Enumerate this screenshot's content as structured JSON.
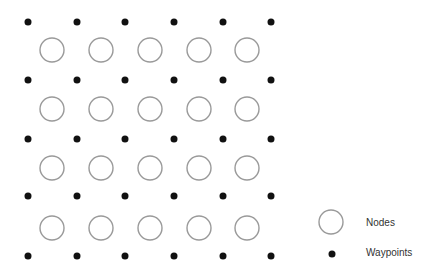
{
  "diagram": {
    "grid": {
      "node_columns_x": [
        52,
        101,
        150,
        199,
        247
      ],
      "node_rows_y": [
        50,
        109,
        168,
        228
      ],
      "node_radius": 12,
      "waypoint_columns_x": [
        28,
        77,
        125,
        174,
        223,
        271
      ],
      "waypoint_rows_y": [
        22,
        80,
        139,
        196,
        256
      ],
      "waypoint_radius": 3.5
    },
    "colors": {
      "node_stroke": "#9a9a9a",
      "waypoint_fill": "#111111"
    },
    "legend": {
      "items": [
        {
          "symbol": "open-circle",
          "label": "Nodes"
        },
        {
          "symbol": "filled-dot",
          "label": "Waypoints"
        }
      ]
    }
  }
}
